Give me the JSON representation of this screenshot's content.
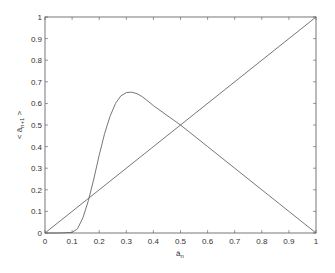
{
  "chart_data": {
    "type": "line",
    "title": "",
    "xlabel": "â_n",
    "ylabel": "< â_{n+1} >",
    "xlim": [
      0,
      1
    ],
    "ylim": [
      0,
      1
    ],
    "grid": false,
    "legend": null,
    "xticks": [
      "0",
      "0.1",
      "0.2",
      "0.3",
      "0.4",
      "0.5",
      "0.6",
      "0.7",
      "0.8",
      "0.9",
      "1"
    ],
    "yticks": [
      "0",
      "0.1",
      "0.2",
      "0.3",
      "0.4",
      "0.5",
      "0.6",
      "0.7",
      "0.8",
      "0.9",
      "1"
    ],
    "series": [
      {
        "name": "identity",
        "x": [
          0,
          1
        ],
        "y": [
          0,
          1
        ]
      },
      {
        "name": "map",
        "x": [
          0,
          0.05,
          0.1,
          0.12,
          0.14,
          0.16,
          0.18,
          0.2,
          0.22,
          0.24,
          0.26,
          0.28,
          0.3,
          0.32,
          0.34,
          0.36,
          0.38,
          0.4,
          0.45,
          0.5,
          0.6,
          0.7,
          0.8,
          0.9,
          1.0
        ],
        "y": [
          0,
          0,
          0.003,
          0.02,
          0.07,
          0.15,
          0.25,
          0.36,
          0.46,
          0.54,
          0.6,
          0.635,
          0.65,
          0.652,
          0.645,
          0.63,
          0.61,
          0.59,
          0.545,
          0.5,
          0.4,
          0.3,
          0.2,
          0.1,
          0.0
        ]
      }
    ]
  },
  "plot": {
    "xlabel_main": "â",
    "xlabel_sub": "n",
    "ylabel_main": "< â",
    "ylabel_sub": "n+1",
    "ylabel_end": " >"
  }
}
